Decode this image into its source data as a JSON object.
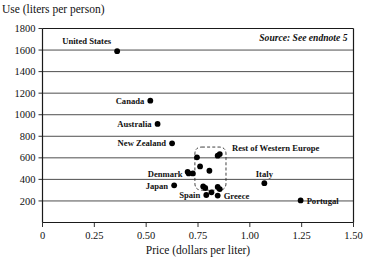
{
  "chart_data": {
    "type": "scatter",
    "title": "Use (liters per person)",
    "xlabel": "Price (dollars per liter)",
    "ylabel": "Use (liters per person)",
    "source_note": "Source: See endnote 5",
    "xlim": [
      0,
      1.5
    ],
    "ylim": [
      0,
      1800
    ],
    "grid": true,
    "legend_position": "none",
    "xticks": [
      "0",
      "0.25",
      "0.50",
      "0.75",
      "1.00",
      "1.25",
      "1.50"
    ],
    "xtick_values": [
      0,
      0.25,
      0.5,
      0.75,
      1.0,
      1.25,
      1.5
    ],
    "yticks": [
      "200",
      "400",
      "600",
      "800",
      "1000",
      "1200",
      "1400",
      "1600",
      "1800"
    ],
    "ytick_values": [
      200,
      400,
      600,
      800,
      1000,
      1200,
      1400,
      1600,
      1800
    ],
    "points": [
      {
        "label": "United States",
        "x": 0.36,
        "y": 1590,
        "label_pos": "above-left"
      },
      {
        "label": "Canada",
        "x": 0.52,
        "y": 1130,
        "label_pos": "left"
      },
      {
        "label": "Australia",
        "x": 0.555,
        "y": 915,
        "label_pos": "left"
      },
      {
        "label": "New Zealand",
        "x": 0.625,
        "y": 735,
        "label_pos": "left"
      },
      {
        "label": "Denmark",
        "x": 0.705,
        "y": 455,
        "label_pos": "left"
      },
      {
        "label": "Japan",
        "x": 0.635,
        "y": 345,
        "label_pos": "left"
      },
      {
        "label": "Spain",
        "x": 0.79,
        "y": 255,
        "label_pos": "left"
      },
      {
        "label": "Greece",
        "x": 0.845,
        "y": 250,
        "label_pos": "right"
      },
      {
        "label": "Italy",
        "x": 1.07,
        "y": 365,
        "label_pos": "above"
      },
      {
        "label": "Portugal",
        "x": 1.245,
        "y": 205,
        "label_pos": "right"
      }
    ],
    "cluster": {
      "label": "Rest of Western Europe",
      "box": {
        "x0": 0.735,
        "x1": 0.885,
        "y0": 300,
        "y1": 700
      },
      "points": [
        {
          "x": 0.745,
          "y": 605
        },
        {
          "x": 0.845,
          "y": 620
        },
        {
          "x": 0.855,
          "y": 635
        },
        {
          "x": 0.76,
          "y": 520
        },
        {
          "x": 0.805,
          "y": 480
        },
        {
          "x": 0.7,
          "y": 470
        },
        {
          "x": 0.725,
          "y": 455
        },
        {
          "x": 0.775,
          "y": 335
        },
        {
          "x": 0.785,
          "y": 320
        },
        {
          "x": 0.845,
          "y": 330
        },
        {
          "x": 0.855,
          "y": 310
        },
        {
          "x": 0.815,
          "y": 280
        }
      ]
    }
  }
}
